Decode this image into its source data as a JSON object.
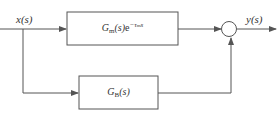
{
  "diagram": {
    "input_label": "x(s)",
    "output_label": "y(s)",
    "blocks": [
      {
        "id": "model",
        "base": "G",
        "subscript": "m",
        "arg": "(s)",
        "exp_base": "e",
        "exp": "−τ",
        "exp_sub": "m",
        "exp_var": "s"
      },
      {
        "id": "bypass",
        "base": "G",
        "subscript": "B",
        "arg": "(s)"
      }
    ],
    "summing_junction": {
      "inputs": [
        "model",
        "bypass"
      ]
    },
    "colors": {
      "line": "#555555",
      "background": "#ffffff"
    }
  }
}
